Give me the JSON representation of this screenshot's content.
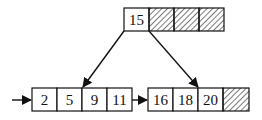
{
  "diagram": {
    "type": "b-plus-tree",
    "root": {
      "keys": [
        "15"
      ],
      "cells": 4,
      "empty_cells_hatched": true
    },
    "leaves": [
      {
        "keys": [
          "2",
          "5",
          "9",
          "11"
        ],
        "cells": 4
      },
      {
        "keys": [
          "16",
          "18",
          "20"
        ],
        "cells": 4,
        "empty_cells_hatched": true
      }
    ],
    "edges": [
      {
        "from": "root.pointer0",
        "to": "leaf0"
      },
      {
        "from": "root.pointer1",
        "to": "leaf1"
      },
      {
        "from": "entry",
        "to": "leaf0"
      },
      {
        "from": "leaf0.next",
        "to": "leaf1"
      }
    ],
    "colors": {
      "stroke": "#111111",
      "fill": "#ffffff"
    }
  }
}
